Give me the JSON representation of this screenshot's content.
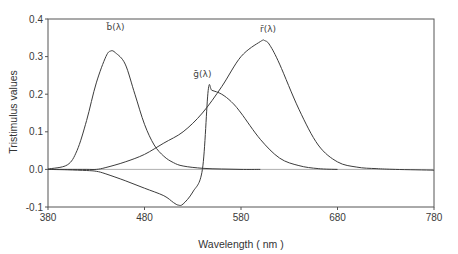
{
  "chart_data": {
    "type": "line",
    "title": "",
    "xlabel": "Wavelength ( nm )",
    "ylabel": "Tristimulus values",
    "xlim": [
      380,
      780
    ],
    "ylim": [
      -0.1,
      0.4
    ],
    "xticks": [
      380,
      480,
      580,
      680,
      780
    ],
    "xtick_labels": [
      "380",
      "480",
      "580",
      "680",
      "780"
    ],
    "yticks": [
      -0.1,
      0.0,
      0.1,
      0.2,
      0.3,
      0.4
    ],
    "ytick_labels": [
      "-0.1",
      "0.0",
      "0.1",
      "0.2",
      "0.3",
      "0.4"
    ],
    "grid": false,
    "zero_line": true,
    "legend": "inline labels",
    "series": [
      {
        "name": "b̄(λ)",
        "label_position": {
          "x": 450,
          "y": 0.37
        },
        "x": [
          380,
          400,
          410,
          420,
          430,
          440,
          445,
          450,
          460,
          470,
          480,
          490,
          500,
          510,
          520,
          540,
          560,
          580,
          600
        ],
        "values": [
          0.001,
          0.012,
          0.05,
          0.13,
          0.23,
          0.3,
          0.315,
          0.31,
          0.28,
          0.2,
          0.12,
          0.065,
          0.035,
          0.018,
          0.009,
          0.003,
          0.001,
          0.0,
          0.0
        ]
      },
      {
        "name": "ḡ(λ)",
        "label_position": {
          "x": 540,
          "y": 0.245
        },
        "x": [
          380,
          400,
          420,
          430,
          440,
          460,
          480,
          500,
          510,
          515,
          520,
          530,
          540,
          546,
          550,
          560,
          570,
          580,
          600,
          620,
          640,
          660,
          680
        ],
        "values": [
          0.0,
          -0.001,
          -0.003,
          -0.005,
          -0.012,
          -0.03,
          -0.05,
          -0.07,
          -0.088,
          -0.095,
          -0.092,
          -0.06,
          0.0,
          0.21,
          0.21,
          0.2,
          0.18,
          0.15,
          0.08,
          0.03,
          0.01,
          0.002,
          0.0
        ]
      },
      {
        "name": "r̄(λ)",
        "label_position": {
          "x": 608,
          "y": 0.365
        },
        "x": [
          380,
          400,
          420,
          430,
          440,
          460,
          480,
          500,
          520,
          540,
          560,
          580,
          600,
          605,
          610,
          620,
          640,
          660,
          680,
          700,
          720,
          740,
          780
        ],
        "values": [
          0.0,
          0.0,
          0.0,
          0.0,
          0.005,
          0.02,
          0.04,
          0.07,
          0.1,
          0.15,
          0.22,
          0.3,
          0.34,
          0.342,
          0.33,
          0.28,
          0.16,
          0.065,
          0.02,
          0.006,
          0.002,
          0.0,
          -0.002
        ]
      }
    ]
  }
}
